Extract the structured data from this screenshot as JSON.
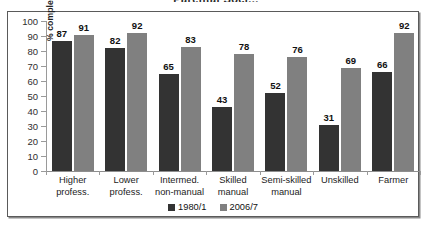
{
  "chart_data": {
    "type": "bar",
    "title": "Parental Soci...",
    "subtitle": "",
    "xlabel": "",
    "ylabel": "% completing Leaving Cert.",
    "ylim": [
      0,
      100
    ],
    "ytick_step": 10,
    "yticks": [
      0,
      10,
      20,
      30,
      40,
      50,
      60,
      70,
      80,
      90,
      100
    ],
    "grid": false,
    "legend_position": "bottom-center",
    "categories": [
      "Higher\nprofess.",
      "Lower\nprofess.",
      "Intermed.\nnon-manual",
      "Skilled\nmanual",
      "Semi-skilled\nmanual",
      "Unskilled",
      "Farmer"
    ],
    "series": [
      {
        "name": "1980/1",
        "color": "#333333",
        "values": [
          87,
          82,
          65,
          43,
          52,
          31,
          66
        ]
      },
      {
        "name": "2006/7",
        "color": "#808080",
        "values": [
          91,
          92,
          83,
          78,
          76,
          69,
          92
        ]
      }
    ]
  }
}
